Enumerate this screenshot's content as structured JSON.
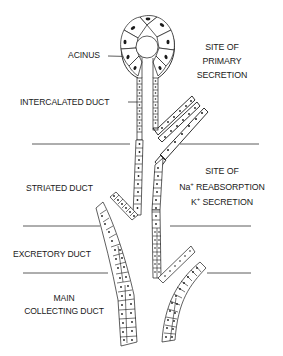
{
  "figure": {
    "labels": {
      "acinus": "ACINUS",
      "intercalated_duct": "INTERCALATED DUCT",
      "striated_duct": "STRIATED DUCT",
      "excretory_duct": "EXCRETORY DUCT",
      "main_collecting_duct_line1": "MAIN",
      "main_collecting_duct_line2": "COLLECTING DUCT"
    },
    "annotations": {
      "primary_secretion": [
        "SITE OF",
        "PRIMARY",
        "SECRETION"
      ],
      "reabsorption": {
        "line1": "SITE OF",
        "na_symbol": "Na",
        "na_sup": "+",
        "line2_rest": " REABSORPTION",
        "k_symbol": "K",
        "k_sup": "+",
        "line3_rest": " SECRETION"
      }
    },
    "colors": {
      "ink": "#1a1a1a",
      "background": "#ffffff"
    }
  }
}
